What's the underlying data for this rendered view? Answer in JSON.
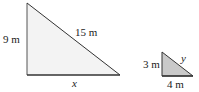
{
  "figure": {
    "large_triangle": {
      "vertical_leg_label": "9 m",
      "hypotenuse_label": "15 m",
      "base_label": "x",
      "fill": "#f3f3f3",
      "stroke": "#333333"
    },
    "small_triangle": {
      "vertical_leg_label": "3 m",
      "hypotenuse_label": "y",
      "base_label": "4 m",
      "fill": "#c9c9c9",
      "stroke": "#333333"
    }
  }
}
